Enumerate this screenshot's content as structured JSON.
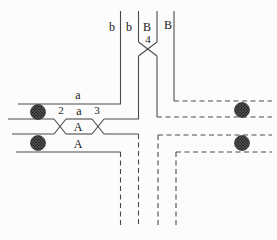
{
  "diagram": {
    "canvas": {
      "width": 277,
      "height": 240
    },
    "colors": {
      "background": "#fcfcfc",
      "line": "#4a4a4a",
      "label": "#1a1a1a",
      "marker_dark": "#2c2c2c",
      "marker_texture": "#5f5f5f"
    },
    "dash_pattern": "5 3.5",
    "solid_paths": [
      "M120.5 11 L120.5 104 L18 104",
      "M138.5 11 L138.5 42",
      "M157 11 L157 42",
      "M138.5 42 L157 56",
      "M157 42 L138.5 56",
      "M174 11 L174 101",
      "M138.5 56 L138.5 119 L104 119",
      "M92 119 L66 119",
      "M54 119 L8 119",
      "M54 119 L66 134",
      "M54 134 L66 119",
      "M92 119 L104 134",
      "M92 134 L104 119",
      "M12 134 L54 134",
      "M66 134 L92 134",
      "M104 134 L138.5 134",
      "M16 152 L120.5 152",
      "M157 56 L157 117"
    ],
    "dashed_paths": [
      "M174 101 L272 101",
      "M157 117 L272 117",
      "M158 135 L272 135",
      "M176 152 L272 152",
      "M120.5 152 L120.5 227",
      "M138.5 134 L138.5 227",
      "M158 135 L158 227",
      "M176 152 L176 227"
    ],
    "markers": [
      {
        "name": "hatched-circle-left-upper",
        "cx": 38,
        "cy": 112,
        "r": 7.5
      },
      {
        "name": "hatched-circle-left-lower",
        "cx": 38,
        "cy": 143,
        "r": 7.5
      },
      {
        "name": "hatched-circle-right-upper",
        "cx": 242,
        "cy": 110,
        "r": 7.5
      },
      {
        "name": "hatched-circle-right-lower",
        "cx": 242,
        "cy": 143,
        "r": 7.5
      }
    ],
    "labels": [
      {
        "text": "b",
        "x": 112,
        "y": 31
      },
      {
        "text": "b",
        "x": 129,
        "y": 31
      },
      {
        "text": "B",
        "x": 147,
        "y": 31
      },
      {
        "text": "B",
        "x": 168,
        "y": 29
      },
      {
        "text": "4",
        "x": 148,
        "y": 43
      },
      {
        "text": "a",
        "x": 78,
        "y": 99
      },
      {
        "text": "2",
        "x": 61,
        "y": 114
      },
      {
        "text": "a",
        "x": 79,
        "y": 115
      },
      {
        "text": "3",
        "x": 97,
        "y": 114
      },
      {
        "text": "A",
        "x": 78,
        "y": 131
      },
      {
        "text": "A",
        "x": 78,
        "y": 148
      }
    ]
  }
}
